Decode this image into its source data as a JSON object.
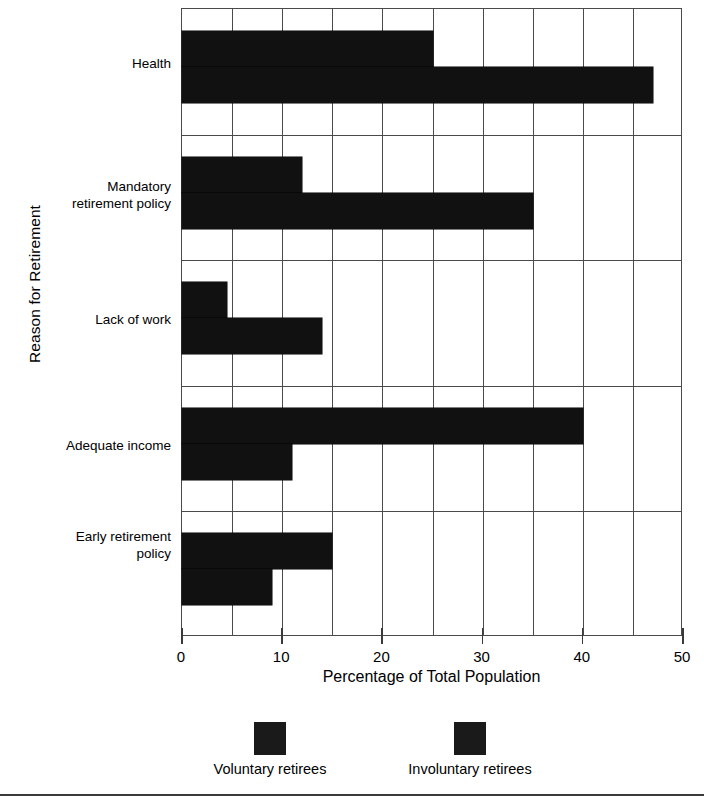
{
  "chart_data": {
    "type": "bar",
    "orientation": "horizontal",
    "title": "",
    "xlabel": "Percentage of Total Population",
    "ylabel": "Reason for Retirement",
    "categories": [
      "Health",
      "Mandatory retirement policy",
      "Lack of work",
      "Adequate income",
      "Early retirement policy"
    ],
    "series": [
      {
        "name": "Voluntary retirees",
        "values": [
          25,
          12,
          4.5,
          40,
          15
        ]
      },
      {
        "name": "Involuntary retirees",
        "values": [
          47,
          35,
          14,
          11,
          9
        ]
      }
    ],
    "xlim": [
      0,
      50
    ],
    "xticks": [
      0,
      10,
      20,
      30,
      40,
      50
    ],
    "xtick_labels": [
      "0",
      "10",
      "20",
      "30",
      "40",
      "50"
    ],
    "minor_gridline_step": 5,
    "grid": true,
    "legend_position": "bottom",
    "bar_color": "#111111"
  },
  "axes": {
    "y_title": "Reason for Retirement",
    "x_title": "Percentage of Total Population",
    "category_labels": [
      {
        "line1": "Health",
        "line2": ""
      },
      {
        "line1": "Mandatory",
        "line2": "retirement policy"
      },
      {
        "line1": "Lack of work",
        "line2": ""
      },
      {
        "line1": "Adequate income",
        "line2": ""
      },
      {
        "line1": "Early retirement",
        "line2": "policy"
      }
    ],
    "x_tick_labels": [
      "0",
      "10",
      "20",
      "30",
      "40",
      "50"
    ]
  },
  "legend": {
    "items": [
      {
        "label": "Voluntary retirees",
        "color": "#1a1a1a"
      },
      {
        "label": "Involuntary retirees",
        "color": "#1a1a1a"
      }
    ]
  }
}
